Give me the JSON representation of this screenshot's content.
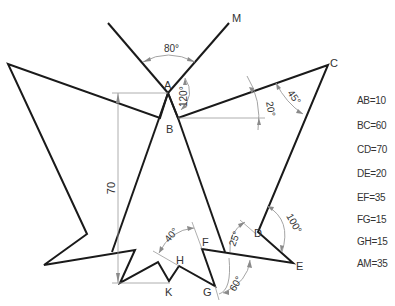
{
  "diagram": {
    "points": {
      "A": "A",
      "B": "B",
      "C": "C",
      "D": "D",
      "E": "E",
      "F": "F",
      "G": "G",
      "H": "H",
      "K": "K",
      "M": "M"
    },
    "angles": {
      "top": "80°",
      "at_a": "120°",
      "at_b": "20°",
      "at_c": "45°",
      "at_d": "100°",
      "at_f": "25°",
      "at_g": "60°",
      "at_h": "40°"
    },
    "dimension_vertical": "70",
    "lengths": [
      "AB=10",
      "BC=60",
      "CD=70",
      "DE=20",
      "EF=35",
      "FG=15",
      "GH=15",
      "AM=35"
    ],
    "colors": {
      "outline": "#1a1a1a",
      "dimension": "#9a9a9a",
      "text": "#333333"
    }
  }
}
